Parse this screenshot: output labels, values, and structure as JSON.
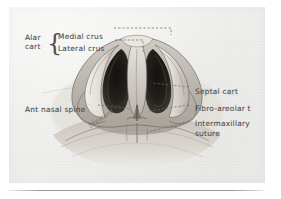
{
  "figure": {
    "type": "anatomical-illustration",
    "medium": "pencil drawing on paper (scanned)",
    "panel_background": "#f1f1ef",
    "ink_color": "#4a4a4a",
    "rule_color": "#787878"
  },
  "labels": {
    "alar_cart": "Alar\ncart",
    "alar_cart_line1": "Alar",
    "alar_cart_line2": "cart",
    "brace": "{",
    "medial_crus": "Medial crus",
    "lateral_crus": "Lateral crus",
    "ant_nasal_spine": "Ant nasal spine",
    "septal_cart": "Septal cart",
    "fibro_areolar": "Fibro-areolar t",
    "intermaxillary_suture": "Intermaxillary\nsuture",
    "intermaxillary_line1": "Intermaxillary",
    "intermaxillary_line2": "suture",
    "signature": "Steward"
  },
  "leaders": {
    "style": "dashed",
    "color": "#6b6b6b",
    "medial_crus": "elbow: right then down to nasal tip / medial crura",
    "lateral_crus": "elbow: right then down to lateral crus of alar cartilage",
    "ant_nasal_spine": "horizontal dashes to midline spine",
    "septal_cart": "horizontal dashes to nasal septum",
    "fibro_areolar": "horizontal dashes to fibro-areolar tissue",
    "intermaxillary_suture": "horizontal dashes to intermaxillary suture"
  }
}
